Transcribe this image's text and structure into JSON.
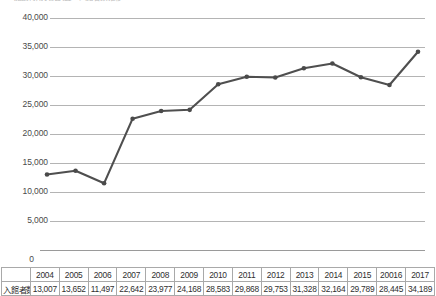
{
  "title": {
    "clipped_text": "施設利用状況調査　入館者数推移"
  },
  "chart_data": {
    "type": "line",
    "title": "",
    "xlabel": "",
    "ylabel": "",
    "categories": [
      "2004",
      "2005",
      "2006",
      "2007",
      "2008",
      "2009",
      "2010",
      "2011",
      "2012",
      "2013",
      "2014",
      "2015",
      "20016",
      "2017"
    ],
    "values": [
      13007,
      13652,
      11497,
      22642,
      23977,
      24168,
      28583,
      29868,
      29753,
      31328,
      32164,
      29789,
      28445,
      34189
    ],
    "series": [
      {
        "name": "入館者数",
        "values": [
          13007,
          13652,
          11497,
          22642,
          23977,
          24168,
          28583,
          29868,
          29753,
          31328,
          32164,
          29789,
          28445,
          34189
        ]
      }
    ],
    "ylim": [
      0,
      40000
    ],
    "yticks": [
      0,
      5000,
      10000,
      15000,
      20000,
      25000,
      30000,
      35000,
      40000
    ],
    "ytick_labels": [
      "0",
      "5,000",
      "10,000",
      "15,000",
      "20,000",
      "25,000",
      "30,000",
      "35,000",
      "40,000"
    ],
    "grid": true,
    "legend": "none",
    "line_color": "#4f4f4f",
    "marker_color": "#4a4a4a",
    "grid_color": "#b4b4b4"
  },
  "table": {
    "row_label": "入館者数",
    "headers": [
      "2004",
      "2005",
      "2006",
      "2007",
      "2008",
      "2009",
      "2010",
      "2011",
      "2012",
      "2013",
      "2014",
      "2015",
      "20016",
      "2017"
    ],
    "values": [
      "13,007",
      "13,652",
      "11,497",
      "22,642",
      "23,977",
      "24,168",
      "28,583",
      "29,868",
      "29,753",
      "31,328",
      "32,164",
      "29,789",
      "28,445",
      "34,189"
    ]
  }
}
